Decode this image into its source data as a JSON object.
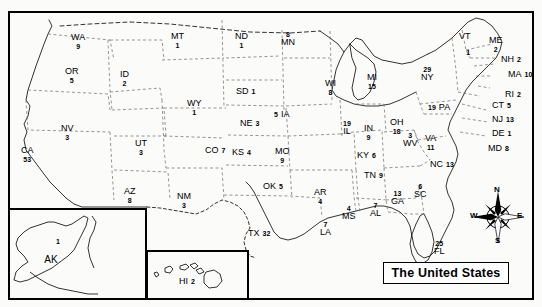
{
  "map": {
    "title": "The United States",
    "compass": {
      "north": "N",
      "south": "S",
      "east": "E",
      "west": "W"
    },
    "states": [
      {
        "code": "WA",
        "value": "9",
        "x": 71,
        "y": 33,
        "layout": "stack"
      },
      {
        "code": "OR",
        "value": "5",
        "x": 65,
        "y": 67,
        "layout": "stack"
      },
      {
        "code": "CA",
        "value": "53",
        "x": 21,
        "y": 146,
        "layout": "stack"
      },
      {
        "code": "NV",
        "value": "3",
        "x": 61,
        "y": 124,
        "layout": "stack"
      },
      {
        "code": "ID",
        "value": "2",
        "x": 120,
        "y": 70,
        "layout": "stack"
      },
      {
        "code": "MT",
        "value": "1",
        "x": 171,
        "y": 32,
        "layout": "stack"
      },
      {
        "code": "WY",
        "value": "1",
        "x": 187,
        "y": 99,
        "layout": "stack"
      },
      {
        "code": "UT",
        "value": "3",
        "x": 135,
        "y": 139,
        "layout": "stack"
      },
      {
        "code": "CO",
        "value": "7",
        "x": 205,
        "y": 146,
        "layout": "inline"
      },
      {
        "code": "AZ",
        "value": "8",
        "x": 124,
        "y": 187,
        "layout": "stack"
      },
      {
        "code": "NM",
        "value": "3",
        "x": 177,
        "y": 192,
        "layout": "stack"
      },
      {
        "code": "ND",
        "value": "1",
        "x": 235,
        "y": 32,
        "layout": "stack"
      },
      {
        "code": "SD",
        "value": "1",
        "x": 236,
        "y": 87,
        "layout": "inline"
      },
      {
        "code": "NE",
        "value": "3",
        "x": 240,
        "y": 119,
        "layout": "inline"
      },
      {
        "code": "KS",
        "value": "4",
        "x": 232,
        "y": 148,
        "layout": "inline"
      },
      {
        "code": "OK",
        "value": "5",
        "x": 263,
        "y": 182,
        "layout": "inline"
      },
      {
        "code": "TX",
        "value": "32",
        "x": 248,
        "y": 229,
        "layout": "inline"
      },
      {
        "code": "MN",
        "value": "8",
        "x": 281,
        "y": 30,
        "layout": "revstack"
      },
      {
        "code": "IA",
        "value": "5",
        "x": 274,
        "y": 110,
        "layout": "revinline"
      },
      {
        "code": "MO",
        "value": "9",
        "x": 275,
        "y": 147,
        "layout": "stack"
      },
      {
        "code": "AR",
        "value": "4",
        "x": 314,
        "y": 188,
        "layout": "stack"
      },
      {
        "code": "LA",
        "value": "7",
        "x": 320,
        "y": 220,
        "layout": "revstack"
      },
      {
        "code": "MS",
        "value": "4",
        "x": 342,
        "y": 204,
        "layout": "revstack"
      },
      {
        "code": "AL",
        "value": "7",
        "x": 370,
        "y": 201,
        "layout": "revstack"
      },
      {
        "code": "TN",
        "value": "9",
        "x": 364,
        "y": 171,
        "layout": "inline"
      },
      {
        "code": "KY",
        "value": "6",
        "x": 357,
        "y": 151,
        "layout": "inline"
      },
      {
        "code": "WI",
        "value": "8",
        "x": 325,
        "y": 79,
        "layout": "stack"
      },
      {
        "code": "IL",
        "value": "19",
        "x": 343,
        "y": 119,
        "layout": "revstack"
      },
      {
        "code": "MI",
        "value": "15",
        "x": 367,
        "y": 73,
        "layout": "stack"
      },
      {
        "code": "IN",
        "value": "9",
        "x": 364,
        "y": 124,
        "layout": "stack"
      },
      {
        "code": "OH",
        "value": "18",
        "x": 390,
        "y": 118,
        "layout": "stack"
      },
      {
        "code": "WV",
        "value": "3",
        "x": 403,
        "y": 131,
        "layout": "revstack"
      },
      {
        "code": "VA",
        "value": "11",
        "x": 425,
        "y": 134,
        "layout": "stack"
      },
      {
        "code": "NC",
        "value": "13",
        "x": 430,
        "y": 160,
        "layout": "inline"
      },
      {
        "code": "SC",
        "value": "6",
        "x": 414,
        "y": 182,
        "layout": "revstack"
      },
      {
        "code": "GA",
        "value": "13",
        "x": 391,
        "y": 189,
        "layout": "revstack"
      },
      {
        "code": "FL",
        "value": "25",
        "x": 434,
        "y": 239,
        "layout": "revstack"
      },
      {
        "code": "PA",
        "value": "19",
        "x": 428,
        "y": 103,
        "layout": "revinline"
      },
      {
        "code": "NY",
        "value": "29",
        "x": 421,
        "y": 65,
        "layout": "revstack"
      },
      {
        "code": "VT",
        "value": "1",
        "x": 459,
        "y": 32,
        "layout": "vt"
      },
      {
        "code": "ME",
        "value": "2",
        "x": 489,
        "y": 36,
        "layout": "stack"
      },
      {
        "code": "NH",
        "value": "2",
        "x": 501,
        "y": 55,
        "layout": "inline"
      },
      {
        "code": "MA",
        "value": "10",
        "x": 508,
        "y": 70,
        "layout": "inline"
      },
      {
        "code": "RI",
        "value": "2",
        "x": 505,
        "y": 90,
        "layout": "inline"
      },
      {
        "code": "CT",
        "value": "5",
        "x": 492,
        "y": 101,
        "layout": "inline"
      },
      {
        "code": "NJ",
        "value": "13",
        "x": 492,
        "y": 115,
        "layout": "inline"
      },
      {
        "code": "DE",
        "value": "1",
        "x": 492,
        "y": 129,
        "layout": "inline"
      },
      {
        "code": "MD",
        "value": "8",
        "x": 488,
        "y": 144,
        "layout": "inline"
      },
      {
        "code": "AK",
        "value": "1",
        "x": 42,
        "y": 237,
        "layout": "akstack"
      },
      {
        "code": "HI",
        "value": "2",
        "x": 179,
        "y": 277,
        "layout": "inline"
      }
    ]
  }
}
